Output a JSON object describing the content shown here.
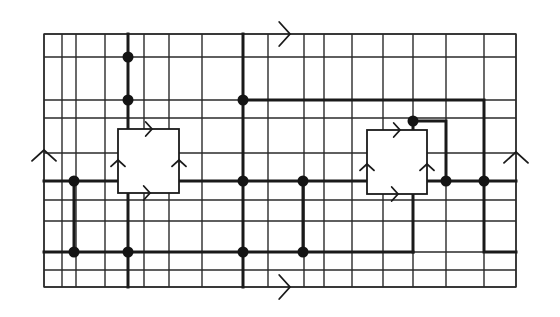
{
  "diagram": {
    "frame": {
      "x0": 44,
      "y0": 34,
      "x1": 516,
      "y1": 287
    },
    "grid_x": [
      44,
      62,
      76,
      105,
      128,
      144,
      169,
      202,
      243,
      268,
      304,
      324,
      352,
      383,
      413,
      446,
      484,
      516
    ],
    "grid_y": [
      34,
      57,
      100,
      118,
      153,
      181,
      200,
      221,
      252,
      270,
      287
    ],
    "boxes": [
      {
        "name": "left-plaquette",
        "x": 118,
        "y": 129,
        "w": 61,
        "h": 64
      },
      {
        "name": "right-plaquette",
        "x": 367,
        "y": 130,
        "w": 60,
        "h": 64
      }
    ],
    "thick_paths": [
      [
        [
          128,
          34
        ],
        [
          128,
          129
        ]
      ],
      [
        [
          44,
          181
        ],
        [
          118,
          181
        ]
      ],
      [
        [
          74,
          181
        ],
        [
          74,
          252
        ]
      ],
      [
        [
          44,
          252
        ],
        [
          413,
          252
        ]
      ],
      [
        [
          128,
          193
        ],
        [
          128,
          287
        ]
      ],
      [
        [
          243,
          34
        ],
        [
          243,
          287
        ]
      ],
      [
        [
          243,
          100
        ],
        [
          484,
          100
        ],
        [
          484,
          252
        ],
        [
          516,
          252
        ]
      ],
      [
        [
          179,
          181
        ],
        [
          367,
          181
        ]
      ],
      [
        [
          303,
          181
        ],
        [
          303,
          252
        ]
      ],
      [
        [
          413,
          121
        ],
        [
          446,
          121
        ],
        [
          446,
          181
        ]
      ],
      [
        [
          413,
          121
        ],
        [
          413,
          130
        ]
      ],
      [
        [
          427,
          181
        ],
        [
          516,
          181
        ]
      ],
      [
        [
          413,
          194
        ],
        [
          413,
          252
        ]
      ]
    ],
    "dots": [
      [
        128,
        57
      ],
      [
        128,
        100
      ],
      [
        243,
        100
      ],
      [
        74,
        181
      ],
      [
        243,
        181
      ],
      [
        303,
        181
      ],
      [
        446,
        181
      ],
      [
        484,
        181
      ],
      [
        413,
        121
      ],
      [
        74,
        252
      ],
      [
        128,
        252
      ],
      [
        243,
        252
      ],
      [
        303,
        252
      ]
    ],
    "arrows": [
      {
        "name": "top-edge-arrow",
        "x": 290,
        "y": 34,
        "dir": "right",
        "size": 12
      },
      {
        "name": "bottom-edge-arrow",
        "x": 290,
        "y": 287,
        "dir": "right",
        "size": 12
      },
      {
        "name": "left-edge-arrow",
        "x": 44,
        "y": 150,
        "dir": "up",
        "size": 12
      },
      {
        "name": "right-edge-arrow",
        "x": 516,
        "y": 152,
        "dir": "up",
        "size": 12
      },
      {
        "name": "left-box-top-arrow",
        "x": 152,
        "y": 129,
        "dir": "right",
        "size": 7
      },
      {
        "name": "left-box-bottom-arrow",
        "x": 150,
        "y": 193,
        "dir": "right",
        "size": 7
      },
      {
        "name": "left-box-left-arrow",
        "x": 118,
        "y": 160,
        "dir": "up",
        "size": 7
      },
      {
        "name": "left-box-right-arrow",
        "x": 179,
        "y": 160,
        "dir": "up",
        "size": 7
      },
      {
        "name": "right-box-top-arrow",
        "x": 400,
        "y": 130,
        "dir": "right",
        "size": 7
      },
      {
        "name": "right-box-bottom-arrow",
        "x": 398,
        "y": 194,
        "dir": "right",
        "size": 7
      },
      {
        "name": "right-box-left-arrow",
        "x": 367,
        "y": 164,
        "dir": "up",
        "size": 7
      },
      {
        "name": "right-box-right-arrow",
        "x": 427,
        "y": 164,
        "dir": "up",
        "size": 7
      }
    ]
  }
}
